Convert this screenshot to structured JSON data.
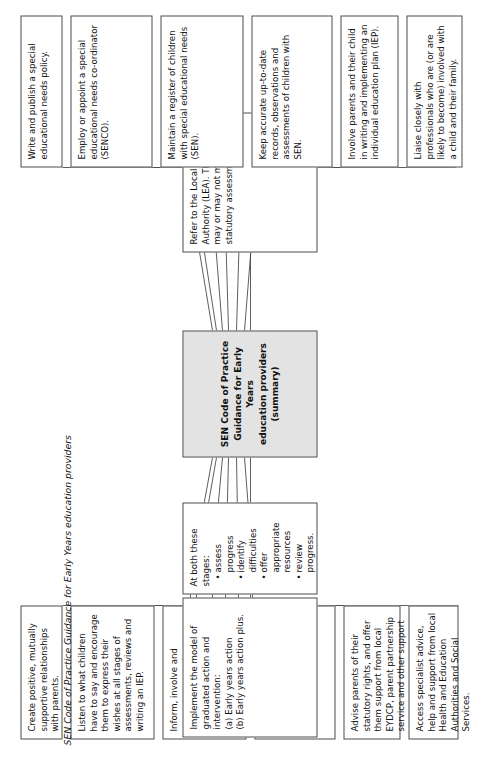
{
  "diagram": {
    "title": "SEN Code of Practice Guidance for Early Years education providers (summary)",
    "center": {
      "line1": "SEN Code of Practice",
      "line2": "Guidance for Early Years",
      "line3": "education providers",
      "line4": "(summary)"
    },
    "parent_branch": [
      {
        "id": "create-positive-relationships",
        "text": "Create positive, mutually supportive relationships with parents."
      },
      {
        "id": "listen-to-children",
        "text": "Listen to what children have to say and encourage them to express their wishes at all stages of assessments, reviews and writing an IEP."
      },
      {
        "id": "inform-involve-support-parents",
        "text": "Inform, involve and support parents in every aspect of their child's difficulties, implementing an IEP and reviews of progress."
      },
      {
        "id": "obtain-permission",
        "text": "Obtain permission of both parent and child before releasing or requesting information about their child."
      },
      {
        "id": "advise-parents-statutory-rights",
        "text": "Advise parents of their statutory rights, and offer them support from local EYDCP, parent partnership service and other support groups."
      },
      {
        "id": "access-specialist-advice",
        "text": "Access specialist advice, help and support from local Health and Education Authorities and Social Services."
      }
    ],
    "graduated_response": {
      "implement_model": {
        "id": "implement-graduated-model",
        "heading": "Implement the model of graduated action and intervention:",
        "items": [
          "(a) Early years action",
          "(b) Early years action plus."
        ]
      },
      "both_stages": {
        "id": "at-both-these-stages",
        "heading": "At both these stages:",
        "bullets": [
          "assess progress",
          "identify difficulties",
          "offer appropriate resources",
          "review progress."
        ]
      }
    },
    "lea_referral": {
      "id": "refer-to-lea",
      "text": "Refer to the Local Education Authority (LEA). The LEA may or may not make a statutory assessment."
    },
    "provider_duties": [
      {
        "id": "write-publish-sen-policy",
        "text": "Write and publish a special educational needs policy."
      },
      {
        "id": "employ-appoint-senco",
        "text": "Employ or appoint a special educational needs co-ordinator (SENCO)."
      },
      {
        "id": "maintain-sen-register",
        "text": "Maintain a register of children with special educational needs (SEN)."
      },
      {
        "id": "keep-accurate-records",
        "text": "Keep accurate up-to-date records, observations and assessments of children with SEN."
      },
      {
        "id": "involve-parents-iep",
        "text": "Involve parents and their child in writing and implementing an individual education plan (IEP)."
      },
      {
        "id": "liaise-with-professionals",
        "text": "Liaise closely with professionals who are (or are likely to become) involved with a child and their family."
      }
    ],
    "caption": "SEN Code of Practice Guidance for Early Years education providers",
    "colors": {
      "center_fill": "#e3e3e3",
      "box_border": "#4c4c4c",
      "line": "#4c4c4c",
      "text": "#111111",
      "page_background": "#ffffff"
    }
  }
}
